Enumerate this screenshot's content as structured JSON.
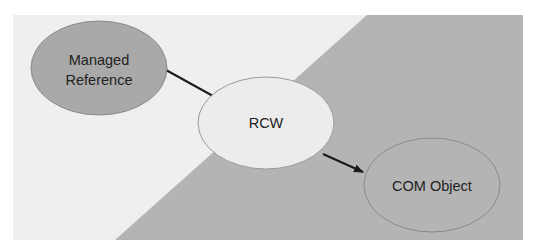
{
  "diagram": {
    "type": "flow",
    "colors": {
      "page_background": "#ffffff",
      "panel_light": "#efefef",
      "panel_dark": "#b4b4b4",
      "edge": "#1a1a1a",
      "node_outline": "#8a8a8a"
    },
    "nodes": [
      {
        "id": "managed",
        "label_line1": "Managed",
        "label_line2": "Reference",
        "fill": "#a9a9a9"
      },
      {
        "id": "rcw",
        "label": "RCW",
        "fill": "#ececec"
      },
      {
        "id": "com",
        "label": "COM Object",
        "fill": "#b4b4b4"
      }
    ],
    "edges": [
      {
        "from": "managed",
        "to": "rcw",
        "arrow": false
      },
      {
        "from": "rcw",
        "to": "com",
        "arrow": true
      }
    ]
  }
}
